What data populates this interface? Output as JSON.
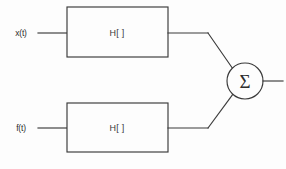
{
  "diagram": {
    "stroke_color": "#3a3a3a",
    "background_color": "#fdfdfd",
    "inputs": [
      {
        "id": "x",
        "label": "x(t)"
      },
      {
        "id": "f",
        "label": "f(t)"
      }
    ],
    "blocks": [
      {
        "id": "top-filter",
        "label": "H[ ]"
      },
      {
        "id": "bottom-filter",
        "label": "H[ ]"
      }
    ],
    "adder": {
      "id": "summing-junction",
      "label": "Σ"
    }
  }
}
